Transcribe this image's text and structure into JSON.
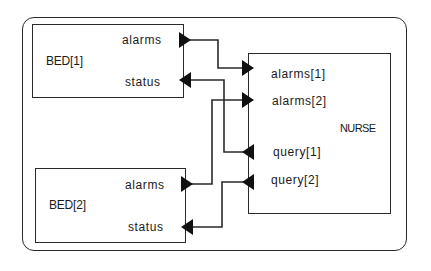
{
  "diagram": {
    "type": "block-connection-diagram",
    "components": [
      {
        "id": "bed1",
        "name": "BED[1]",
        "ports": [
          {
            "label": "alarms",
            "direction": "out"
          },
          {
            "label": "status",
            "direction": "in"
          }
        ]
      },
      {
        "id": "bed2",
        "name": "BED[2]",
        "ports": [
          {
            "label": "alarms",
            "direction": "out"
          },
          {
            "label": "status",
            "direction": "in"
          }
        ]
      },
      {
        "id": "nurse",
        "name": "NURSE",
        "ports": [
          {
            "label": "alarms[1]",
            "direction": "in"
          },
          {
            "label": "alarms[2]",
            "direction": "in"
          },
          {
            "label": "query[1]",
            "direction": "out"
          },
          {
            "label": "query[2]",
            "direction": "out"
          }
        ]
      }
    ],
    "connections": [
      {
        "from": "BED[1].alarms",
        "to": "NURSE.alarms[1]"
      },
      {
        "from": "BED[2].alarms",
        "to": "NURSE.alarms[2]"
      },
      {
        "from": "NURSE.query[1]",
        "to": "BED[1].status"
      },
      {
        "from": "NURSE.query[2]",
        "to": "BED[2].status"
      }
    ],
    "colors": {
      "stroke": "#2a2a2a",
      "text": "#1a1a1a",
      "background": "#ffffff"
    }
  },
  "bed1": {
    "name": "BED[1]",
    "port_alarms": "alarms",
    "port_status": "status"
  },
  "bed2": {
    "name": "BED[2]",
    "port_alarms": "alarms",
    "port_status": "status"
  },
  "nurse": {
    "name": "NURSE",
    "port_alarms1": "alarms[1]",
    "port_alarms2": "alarms[2]",
    "port_query1": "query[1]",
    "port_query2": "query[2]"
  }
}
